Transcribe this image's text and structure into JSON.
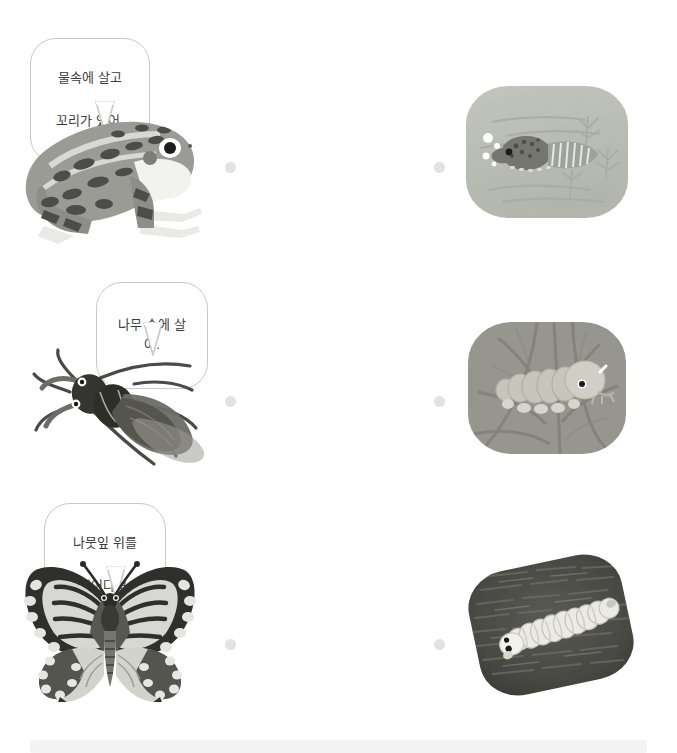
{
  "page": {
    "background_color": "#ffffff",
    "dot_color": "#e2e2e2",
    "bubble_border_color": "#c9c9c9",
    "text_color": "#3b3b3b"
  },
  "rows": [
    {
      "id": "row-frog",
      "bubble": {
        "lines": [
          "물속에 살고",
          "꼬리가 있어."
        ],
        "line1": "물속에 살고",
        "line2": "꼬리가 있어."
      },
      "left_illustration": {
        "name": "frog-illustration",
        "alt": "개구리"
      },
      "right_panel": {
        "name": "tadpole-photo",
        "alt": "물속의 올챙이",
        "background_color": "#b9bdb4",
        "subject_color": "#7d7f78"
      },
      "left_dot": "left-dot-1",
      "right_dot": "right-dot-1"
    },
    {
      "id": "row-beetle",
      "bubble": {
        "lines": [
          "나무 속에 살아."
        ],
        "line1": "나무 속에 살아.",
        "line2": ""
      },
      "left_illustration": {
        "name": "stag-beetle-illustration",
        "alt": "하늘소"
      },
      "right_panel": {
        "name": "beetle-larva-photo",
        "alt": "나무 속의 애벌레",
        "background_color": "#9a9a93",
        "subject_color": "#c9c9c0"
      },
      "left_dot": "left-dot-2",
      "right_dot": "right-dot-2"
    },
    {
      "id": "row-butterfly",
      "bubble": {
        "lines": [
          "나뭇잎 위를",
          "기어다녀."
        ],
        "line1": "나뭇잎 위를",
        "line2": "기어다녀."
      },
      "left_illustration": {
        "name": "swallowtail-butterfly-illustration",
        "alt": "호랑나비"
      },
      "right_panel": {
        "name": "caterpillar-photo",
        "alt": "나뭇잎 위의 애벌레",
        "background_color": "#4a4a46",
        "subject_color": "#e8e8e2"
      },
      "left_dot": "left-dot-3",
      "right_dot": "right-dot-3"
    }
  ]
}
